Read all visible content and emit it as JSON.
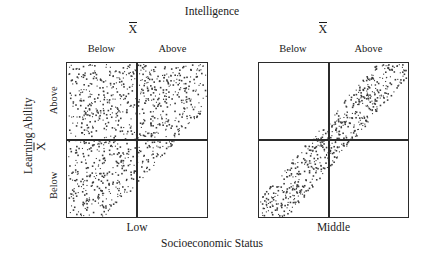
{
  "chart_data": {
    "type": "scatter",
    "title": "Intelligence",
    "xlabel": "Socioeconomic Status",
    "ylabel": "Learning Ability",
    "grid": false,
    "legend": null,
    "mean_symbol": "X",
    "panels": [
      {
        "id": "low",
        "xlabel": "Low",
        "top_mean_label": "X",
        "column_labels": [
          "Below",
          "Above"
        ],
        "row_labels": [
          "Above",
          "Below"
        ],
        "description": "Broad dispersed cloud of points filling the region above a rising diagonal boundary; weak positive relationship with large scatter",
        "axis_ranges": {
          "x": [
            0,
            1
          ],
          "y": [
            0,
            1
          ]
        },
        "mean_lines": {
          "x": 0.5,
          "y": 0.5
        },
        "band": {
          "lower_intercept": -0.28,
          "upper_intercept": 1.35,
          "slope": 1.0
        },
        "point_count": 980,
        "quadrant_density": {
          "above_below": "dense",
          "above_above": "partial",
          "below_below": "partial",
          "below_above": "empty"
        }
      },
      {
        "id": "middle",
        "xlabel": "Middle",
        "top_mean_label": "X",
        "column_labels": [
          "Below",
          "Above"
        ],
        "row_labels": [
          "Above",
          "Below"
        ],
        "description": "Narrow diagonal band of points from lower-left to upper-right; strong positive correlation with little scatter",
        "axis_ranges": {
          "x": [
            0,
            1
          ],
          "y": [
            0,
            1
          ]
        },
        "mean_lines": {
          "x": 0.46,
          "y": 0.5
        },
        "band": {
          "lower_intercept": -0.2,
          "upper_intercept": 0.12,
          "slope": 1.12
        },
        "point_count": 620,
        "quadrant_density": {
          "above_below": "sparse-edge",
          "above_above": "dense-band",
          "below_below": "dense-band",
          "below_above": "sparse-edge"
        }
      }
    ],
    "axis_labels": {
      "row_above": "Above",
      "row_below": "Below",
      "col_below": "Below",
      "col_above": "Above"
    },
    "colors": {
      "frame": "#2b2b2b",
      "points": "#3a3a3a",
      "background": "#ffffff",
      "text": "#1a1a1a"
    }
  },
  "figure": {
    "title": "Intelligence",
    "xaxis_title": "Socioeconomic Status",
    "yaxis_title": "Learning Ability",
    "mean_symbol": "X",
    "row_label_above": "Above",
    "row_label_below": "Below",
    "panel_low": {
      "xlabel": "Low",
      "col_below": "Below",
      "col_above": "Above",
      "mean_symbol": "X"
    },
    "panel_middle": {
      "xlabel": "Middle",
      "col_below": "Below",
      "col_above": "Above",
      "mean_symbol": "X"
    }
  }
}
